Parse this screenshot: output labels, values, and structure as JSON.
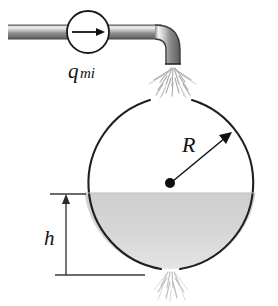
{
  "figure": {
    "labels": {
      "flow_rate": "q",
      "flow_rate_subscript": "mi",
      "radius": "R",
      "height": "h"
    },
    "colors": {
      "outline": "#1a1a1a",
      "water_fill": "#d2d2d2",
      "water_fill_light": "#e2e2e2",
      "pipe_light": "#f2f2f2",
      "pipe_mid": "#9a9a9a",
      "pipe_dark": "#6d6d6d",
      "spray": "#b3b3b3",
      "spray_faint": "#cfcfcf",
      "dimension_line": "#3a3a3a",
      "background": "#ffffff"
    },
    "geometry": {
      "sphere_center_x": 170,
      "sphere_center_y": 183,
      "sphere_radius": 87,
      "waterline_y": 193,
      "baseline_y": 275,
      "pump_center_x": 88,
      "pump_center_y": 32,
      "pump_radius": 21,
      "pipe_y": 32,
      "pipe_start_x": 8,
      "nozzle_x": 172,
      "nozzle_y": 62
    },
    "parts": {
      "pump": "pump-symbol",
      "pipe": "supply-pipe",
      "elbow": "pipe-elbow",
      "nozzle": "nozzle-outlet",
      "inlet_spray": "inlet-water-spray",
      "outlet_spray": "outlet-water-spray",
      "tank": "spherical-tank",
      "water": "water-body",
      "radius_arrow": "radius-dimension-arrow",
      "center_dot": "sphere-center-dot",
      "height_dimension": "height-dimension",
      "ground_line": "ground-reference-line",
      "flow_arrow": "flow-direction-arrow"
    }
  }
}
